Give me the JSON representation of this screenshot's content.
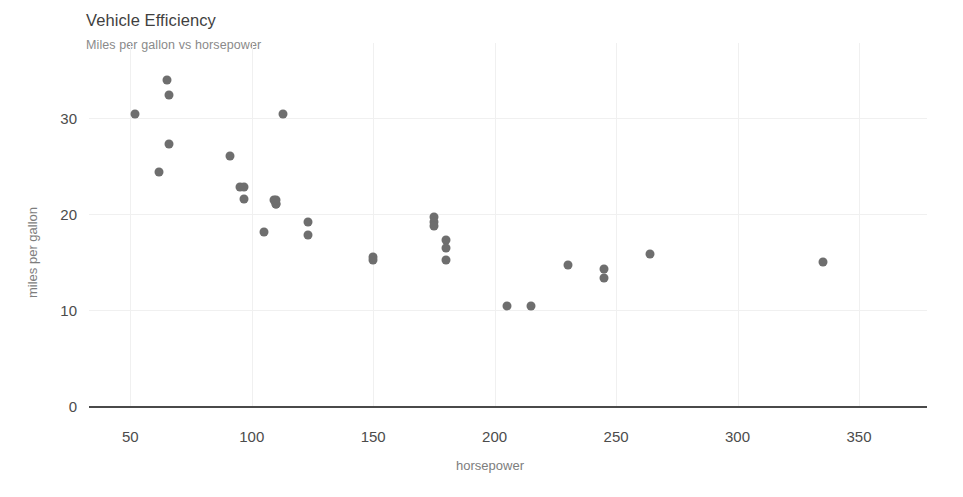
{
  "chart_data": {
    "type": "scatter",
    "title": "Vehicle Efficiency",
    "subtitle": "Miles per gallon vs horsepower",
    "xlabel": "horsepower",
    "ylabel": "miles per gallon",
    "xlim": [
      33,
      378
    ],
    "ylim": [
      0,
      35.5
    ],
    "xticks": [
      50,
      100,
      150,
      200,
      250,
      300,
      350
    ],
    "xtick_labels": [
      "50",
      "100",
      "150",
      "200",
      "250",
      "300",
      "350"
    ],
    "yticks": [
      0,
      10,
      20,
      30
    ],
    "ytick_labels": [
      "0",
      "10",
      "20",
      "30"
    ],
    "grid": true,
    "legend": null,
    "marker_color": "#6e6e6e",
    "marker_size": 9,
    "axis_color": "#4a4a4a",
    "grid_color": "#f0f0f0",
    "title_color": "#3f3f3f",
    "subtitle_color": "#8a8a8a",
    "tick_label_color": "#4c4c4c",
    "axis_title_color": "#7d7d7d",
    "points": [
      {
        "x": 52,
        "y": 30.4
      },
      {
        "x": 62,
        "y": 24.4
      },
      {
        "x": 65,
        "y": 33.9
      },
      {
        "x": 66,
        "y": 32.4
      },
      {
        "x": 66,
        "y": 27.3
      },
      {
        "x": 91,
        "y": 26.0
      },
      {
        "x": 95,
        "y": 22.8
      },
      {
        "x": 97,
        "y": 22.8
      },
      {
        "x": 97,
        "y": 21.5
      },
      {
        "x": 105,
        "y": 18.1
      },
      {
        "x": 109,
        "y": 21.4
      },
      {
        "x": 110,
        "y": 21.0
      },
      {
        "x": 110,
        "y": 21.0
      },
      {
        "x": 110,
        "y": 21.4
      },
      {
        "x": 113,
        "y": 30.4
      },
      {
        "x": 123,
        "y": 19.2
      },
      {
        "x": 123,
        "y": 17.8
      },
      {
        "x": 150,
        "y": 15.2
      },
      {
        "x": 150,
        "y": 15.5
      },
      {
        "x": 175,
        "y": 19.2
      },
      {
        "x": 175,
        "y": 19.7
      },
      {
        "x": 175,
        "y": 18.7
      },
      {
        "x": 180,
        "y": 17.3
      },
      {
        "x": 180,
        "y": 16.4
      },
      {
        "x": 180,
        "y": 15.2
      },
      {
        "x": 205,
        "y": 10.4
      },
      {
        "x": 215,
        "y": 10.4
      },
      {
        "x": 230,
        "y": 14.7
      },
      {
        "x": 245,
        "y": 14.3
      },
      {
        "x": 245,
        "y": 13.3
      },
      {
        "x": 264,
        "y": 15.8
      },
      {
        "x": 335,
        "y": 15.0
      }
    ]
  },
  "labels": {
    "title": "Vehicle Efficiency",
    "subtitle": "Miles per gallon vs horsepower",
    "x_axis_title": "horsepower",
    "y_axis_title": "miles per gallon"
  }
}
